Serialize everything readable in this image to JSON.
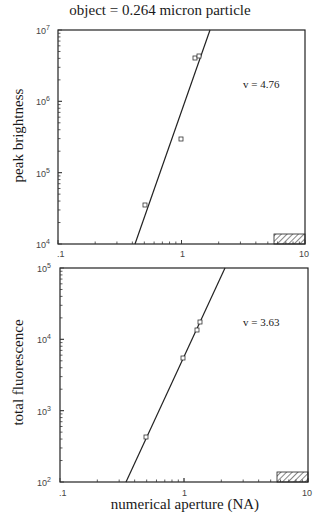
{
  "title": "object = 0.264 micron particle",
  "xlabel": "numerical aperture (NA)",
  "chart_data": [
    {
      "type": "scatter",
      "title": "object = 0.264 micron particle",
      "xlabel": "numerical aperture (NA)",
      "ylabel": "peak brightness",
      "xscale": "log",
      "yscale": "log",
      "xlim": [
        0.1,
        10
      ],
      "ylim": [
        10000,
        10000000
      ],
      "x_tick_labels": [
        ".1",
        "1",
        "10"
      ],
      "y_tick_labels": [
        "10^4",
        "10^5",
        "10^6",
        "10^7"
      ],
      "series": [
        {
          "name": "data",
          "marker": "square",
          "x": [
            0.5,
            1.0,
            1.3,
            1.4
          ],
          "y": [
            35000,
            290000,
            4000000,
            4400000
          ]
        }
      ],
      "fit_line": {
        "slope_label": "v = 4.76",
        "exponent": 4.76,
        "x_range": [
          0.42,
          1.6
        ]
      },
      "annotation": "v = 4.76",
      "hatched_region": {
        "x": [
          5.5,
          10
        ],
        "note": "hatched box at bottom right"
      },
      "grid": false
    },
    {
      "type": "scatter",
      "xlabel": "numerical aperture (NA)",
      "ylabel": "total fluorescence",
      "xscale": "log",
      "yscale": "log",
      "xlim": [
        0.1,
        10
      ],
      "ylim": [
        100,
        100000
      ],
      "x_tick_labels": [
        ".1",
        "1",
        "10"
      ],
      "y_tick_labels": [
        "10^2",
        "10^3",
        "10^4",
        "10^5"
      ],
      "series": [
        {
          "name": "data",
          "marker": "square",
          "x": [
            0.5,
            1.0,
            1.3,
            1.35
          ],
          "y": [
            430,
            5500,
            14000,
            17000
          ]
        }
      ],
      "fit_line": {
        "slope_label": "v = 3.63",
        "exponent": 3.63,
        "x_range": [
          0.34,
          2.3
        ]
      },
      "annotation": "v = 3.63",
      "hatched_region": {
        "x": [
          5.5,
          10
        ],
        "note": "hatched box at bottom right"
      },
      "grid": false
    }
  ],
  "plots": [
    {
      "ylabel": "peak brightness",
      "nu": "v = 4.76",
      "yticks": [
        {
          "b": "10",
          "e": "7"
        },
        {
          "b": "10",
          "e": "6"
        },
        {
          "b": "10",
          "e": "5"
        },
        {
          "b": "10",
          "e": "4"
        }
      ],
      "xticks": [
        ".1",
        "1",
        "10"
      ]
    },
    {
      "ylabel": "total fluorescence",
      "nu": "v = 3.63",
      "yticks": [
        {
          "b": "10",
          "e": "5"
        },
        {
          "b": "10",
          "e": "4"
        },
        {
          "b": "10",
          "e": "3"
        },
        {
          "b": "10",
          "e": "2"
        }
      ],
      "xticks": [
        ".1",
        "1",
        "10"
      ]
    }
  ]
}
